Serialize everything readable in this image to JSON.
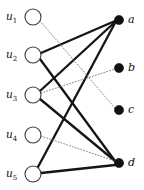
{
  "figure": {
    "kind": "bipartite-graph",
    "width": 144,
    "height": 190,
    "background": "#ffffff"
  },
  "style": {
    "open_node_fill": "#ffffff",
    "open_node_stroke": "#3a3a3a",
    "filled_node_fill": "#111111",
    "solid_edge_color": "#151515",
    "dotted_edge_color": "#777777",
    "label_color": "#111111"
  },
  "left_nodes": [
    {
      "id": "u1",
      "label": "u",
      "sub": "1",
      "cx": 33,
      "cy": 17,
      "r": 8,
      "shape": "open-circle"
    },
    {
      "id": "u2",
      "label": "u",
      "sub": "2",
      "cx": 33,
      "cy": 55,
      "r": 8,
      "shape": "open-circle"
    },
    {
      "id": "u3",
      "label": "u",
      "sub": "3",
      "cx": 33,
      "cy": 95,
      "r": 8,
      "shape": "open-circle"
    },
    {
      "id": "u4",
      "label": "u",
      "sub": "4",
      "cx": 33,
      "cy": 135,
      "r": 8,
      "shape": "open-circle"
    },
    {
      "id": "u5",
      "label": "u",
      "sub": "5",
      "cx": 33,
      "cy": 174,
      "r": 8,
      "shape": "open-circle"
    }
  ],
  "right_nodes": [
    {
      "id": "a",
      "label": "a",
      "cx": 119,
      "cy": 20,
      "r": 4.6,
      "shape": "filled-circle"
    },
    {
      "id": "b",
      "label": "b",
      "cx": 119,
      "cy": 68,
      "r": 4.6,
      "shape": "filled-circle"
    },
    {
      "id": "c",
      "label": "c",
      "cx": 119,
      "cy": 110,
      "r": 4.6,
      "shape": "filled-circle"
    },
    {
      "id": "d",
      "label": "d",
      "cx": 119,
      "cy": 163,
      "r": 4.6,
      "shape": "filled-circle"
    }
  ],
  "edges": [
    {
      "id": "e-u2-a",
      "from": "u2",
      "to": "a",
      "style": "solid",
      "weight": 2.3,
      "x1": 41,
      "y1": 53,
      "x2": 115,
      "y2": 21
    },
    {
      "id": "e-u2-d",
      "from": "u2",
      "to": "d",
      "style": "solid",
      "weight": 2.3,
      "x1": 40,
      "y1": 59,
      "x2": 115,
      "y2": 161
    },
    {
      "id": "e-u3-a",
      "from": "u3",
      "to": "a",
      "style": "solid",
      "weight": 2.3,
      "x1": 40,
      "y1": 91,
      "x2": 115,
      "y2": 22
    },
    {
      "id": "e-u3-d",
      "from": "u3",
      "to": "d",
      "style": "solid",
      "weight": 2.3,
      "x1": 40,
      "y1": 99,
      "x2": 115,
      "y2": 161
    },
    {
      "id": "e-u5-a",
      "from": "u5",
      "to": "a",
      "style": "solid",
      "weight": 2.3,
      "x1": 38,
      "y1": 167,
      "x2": 115,
      "y2": 23
    },
    {
      "id": "e-u5-d",
      "from": "u5",
      "to": "d",
      "style": "solid",
      "weight": 2.3,
      "x1": 41,
      "y1": 173,
      "x2": 115,
      "y2": 165
    },
    {
      "id": "e-u1-c",
      "from": "u1",
      "to": "c",
      "style": "dotted",
      "weight": 0.85,
      "x1": 40,
      "y1": 21,
      "x2": 115,
      "y2": 108
    },
    {
      "id": "e-u3-b",
      "from": "u3",
      "to": "b",
      "style": "dotted",
      "weight": 0.85,
      "x1": 41,
      "y1": 93,
      "x2": 115,
      "y2": 69
    },
    {
      "id": "e-u4-d",
      "from": "u4",
      "to": "d",
      "style": "dotted",
      "weight": 0.85,
      "x1": 41,
      "y1": 136,
      "x2": 115,
      "y2": 161
    }
  ],
  "labels": {
    "u1": "u",
    "u1_sub": "1",
    "u2": "u",
    "u2_sub": "2",
    "u3": "u",
    "u3_sub": "3",
    "u4": "u",
    "u4_sub": "4",
    "u5": "u",
    "u5_sub": "5",
    "a": "a",
    "b": "b",
    "c": "c",
    "d": "d"
  }
}
